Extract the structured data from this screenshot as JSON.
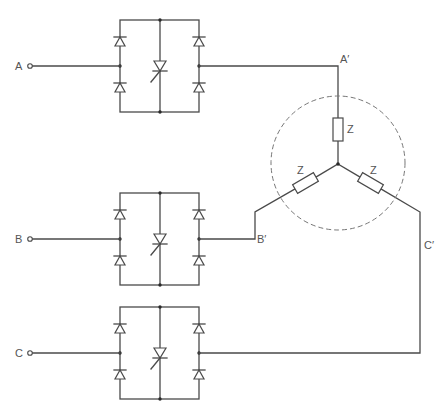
{
  "diagram": {
    "phases": [
      {
        "id": "A",
        "input_label": "A",
        "output_label": "A′"
      },
      {
        "id": "B",
        "input_label": "B",
        "output_label": "B′"
      },
      {
        "id": "C",
        "input_label": "C",
        "output_label": "C′"
      }
    ],
    "load": {
      "connection": "star",
      "impedance_label": "Z",
      "branches": [
        "A′",
        "B′",
        "C′"
      ],
      "enclosure": "dashed circle"
    },
    "bridge": {
      "diodes_per_bridge": 4,
      "switch": "thyristor"
    },
    "colors": {
      "line": "#4a4a4a",
      "background": "#ffffff",
      "dashed": "#777777"
    }
  }
}
